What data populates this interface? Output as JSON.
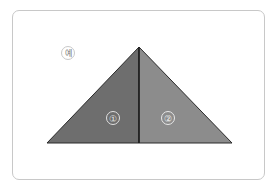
{
  "example_label": "예",
  "parts": [
    {
      "label": "①",
      "color": "#6e6e6e"
    },
    {
      "label": "②",
      "color": "#8c8c8c"
    }
  ],
  "colors": {
    "border": "#c8c8c8",
    "edge": "#2a2a2a"
  }
}
